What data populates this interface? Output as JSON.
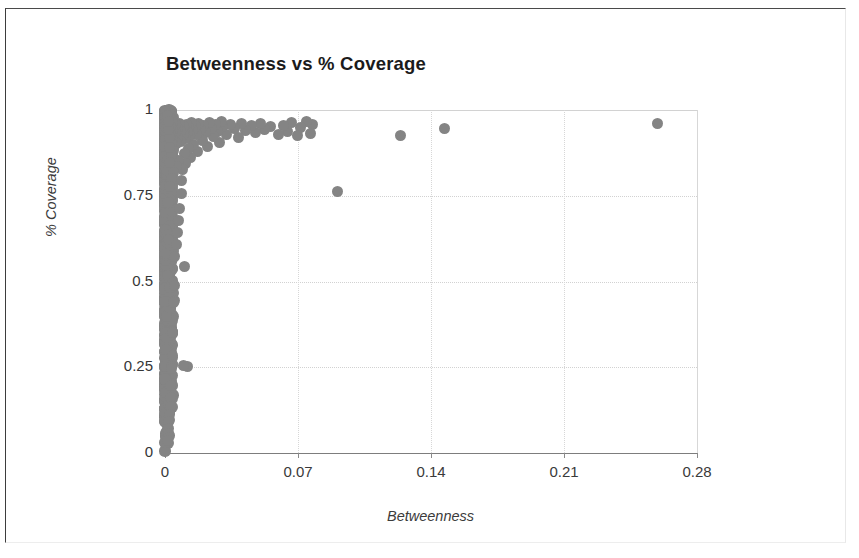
{
  "figure": {
    "border_color": "#3d3d3d",
    "background": "#ffffff"
  },
  "chart_data": {
    "type": "scatter",
    "title": "Betweenness vs % Coverage",
    "xlabel": "Betweenness",
    "ylabel": "% Coverage",
    "xlim": [
      0,
      0.28
    ],
    "ylim": [
      0,
      1
    ],
    "xticks": [
      "0",
      "0.07",
      "0.14",
      "0.21",
      "0.28"
    ],
    "xtick_values": [
      0,
      0.07,
      0.14,
      0.21,
      0.28
    ],
    "yticks": [
      "0",
      "0.25",
      "0.5",
      "0.75",
      "1"
    ],
    "ytick_values": [
      0,
      0.25,
      0.5,
      0.75,
      1
    ],
    "grid": true,
    "legend": null,
    "marker": {
      "color": "#848484",
      "shape": "circle",
      "size_px": 11
    },
    "series": [
      {
        "name": "nodes",
        "description": "Dense mass of points hugging the zero-betweenness axis spanning the full coverage range, with a sparse tail of higher-betweenness outliers near high coverage.",
        "points": [
          [
            0.259,
            0.962
          ],
          [
            0.147,
            0.947
          ],
          [
            0.124,
            0.925
          ],
          [
            0.091,
            0.761
          ],
          [
            0.0775,
            0.958
          ],
          [
            0.0765,
            0.931
          ],
          [
            0.0745,
            0.966
          ],
          [
            0.0715,
            0.949
          ],
          [
            0.0695,
            0.926
          ],
          [
            0.0665,
            0.963
          ],
          [
            0.0645,
            0.938
          ],
          [
            0.0625,
            0.955
          ],
          [
            0.0595,
            0.93
          ],
          [
            0.0555,
            0.952
          ],
          [
            0.0525,
            0.943
          ],
          [
            0.0505,
            0.96
          ],
          [
            0.0475,
            0.934
          ],
          [
            0.0455,
            0.955
          ],
          [
            0.0425,
            0.941
          ],
          [
            0.0405,
            0.962
          ],
          [
            0.0385,
            0.919
          ],
          [
            0.0365,
            0.947
          ],
          [
            0.0345,
            0.957
          ],
          [
            0.0325,
            0.93
          ],
          [
            0.0305,
            0.951
          ],
          [
            0.0295,
            0.966
          ],
          [
            0.0285,
            0.906
          ],
          [
            0.0275,
            0.938
          ],
          [
            0.0265,
            0.958
          ],
          [
            0.0255,
            0.922
          ],
          [
            0.0245,
            0.947
          ],
          [
            0.0235,
            0.963
          ],
          [
            0.0225,
            0.893
          ],
          [
            0.0215,
            0.935
          ],
          [
            0.0205,
            0.955
          ],
          [
            0.0195,
            0.911
          ],
          [
            0.0185,
            0.944
          ],
          [
            0.0178,
            0.961
          ],
          [
            0.0172,
            0.878
          ],
          [
            0.0165,
            0.93
          ],
          [
            0.0158,
            0.952
          ],
          [
            0.0152,
            0.9
          ],
          [
            0.0146,
            0.941
          ],
          [
            0.014,
            0.965
          ],
          [
            0.0135,
            0.862
          ],
          [
            0.013,
            0.925
          ],
          [
            0.0126,
            0.948
          ],
          [
            0.0122,
            0.887
          ],
          [
            0.0118,
            0.933
          ],
          [
            0.0114,
            0.958
          ],
          [
            0.011,
            0.845
          ],
          [
            0.0107,
            0.918
          ],
          [
            0.0104,
            0.943
          ],
          [
            0.0101,
            0.872
          ],
          [
            0.0098,
            0.929
          ],
          [
            0.0095,
            0.953
          ],
          [
            0.0117,
            0.252
          ],
          [
            0.0098,
            0.256
          ],
          [
            0.0105,
            0.545
          ],
          [
            0.0092,
            0.827
          ],
          [
            0.0088,
            0.795
          ],
          [
            0.0085,
            0.756
          ],
          [
            0.0082,
            0.908
          ],
          [
            0.0079,
            0.937
          ],
          [
            0.0076,
            0.962
          ],
          [
            0.0074,
            0.712
          ],
          [
            0.0072,
            0.677
          ],
          [
            0.007,
            0.852
          ],
          [
            0.0068,
            0.921
          ],
          [
            0.0066,
            0.946
          ],
          [
            0.0064,
            0.642
          ],
          [
            0.0062,
            0.607
          ],
          [
            0.006,
            0.836
          ],
          [
            0.0058,
            0.901
          ],
          [
            0.0056,
            0.934
          ],
          [
            0.0054,
            0.958
          ],
          [
            0.0052,
            0.572
          ],
          [
            0.005,
            0.489
          ],
          [
            0.0048,
            0.444
          ],
          [
            0.0046,
            0.441
          ],
          [
            0.0045,
            0.438
          ],
          [
            0.0044,
            0.817
          ],
          [
            0.0043,
            0.882
          ],
          [
            0.0042,
            0.915
          ],
          [
            0.0041,
            0.941
          ],
          [
            0.004,
            0.963
          ],
          [
            0.0039,
            0.351
          ],
          [
            0.0038,
            0.283
          ],
          [
            0.0037,
            0.258
          ],
          [
            0.0036,
            0.251
          ],
          [
            0.0035,
            0.246
          ],
          [
            0.0034,
            0.801
          ],
          [
            0.0033,
            0.866
          ],
          [
            0.0032,
            0.903
          ],
          [
            0.0031,
            0.928
          ],
          [
            0.003,
            0.951
          ],
          [
            0.0029,
            0.196
          ],
          [
            0.0028,
            0.161
          ],
          [
            0.0027,
            0.137
          ],
          [
            0.0026,
            0.112
          ],
          [
            0.0025,
            0.776
          ],
          [
            0.0024,
            0.847
          ],
          [
            0.0023,
            0.89
          ],
          [
            0.0022,
            0.921
          ],
          [
            0.0021,
            0.944
          ],
          [
            0.002,
            0.966
          ],
          [
            0.0019,
            0.092
          ],
          [
            0.0018,
            0.071
          ],
          [
            0.0017,
            0.058
          ],
          [
            0.0016,
            0.046
          ],
          [
            0.0015,
            0.035
          ]
        ],
        "axis_band": {
          "description": "Continuous dense band of points from y=0 to y=1 at betweenness between 0 and about 0.004",
          "x_range": [
            0.0,
            0.0042
          ],
          "y_range": [
            0.0,
            1.0
          ],
          "count_estimate": 1400
        }
      }
    ]
  }
}
